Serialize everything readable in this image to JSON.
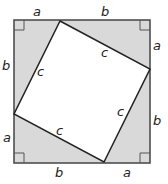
{
  "diagram": {
    "colors": {
      "triangle_fill": "#d9d9d9",
      "inner_fill": "#ffffff",
      "stroke": "#333333"
    },
    "outer_square": {
      "x": 14,
      "y": 20,
      "w": 136,
      "h": 143
    },
    "inner_square_points": "60,21 150,69 104,162 14,114",
    "labels": {
      "top_a": "a",
      "top_b": "b",
      "right_a": "a",
      "right_b": "b",
      "bottom_b": "b",
      "bottom_a": "a",
      "left_b": "b",
      "left_a": "a",
      "c_top_left": "c",
      "c_top_right": "c",
      "c_bottom_right": "c",
      "c_bottom_left": "c"
    }
  }
}
